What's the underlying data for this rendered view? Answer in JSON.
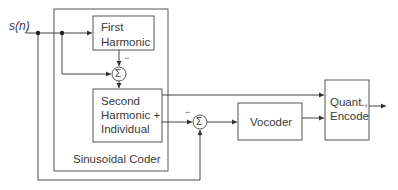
{
  "input_signal": {
    "label": "s(n)"
  },
  "outer_block": {
    "label": "Sinusoidal Coder"
  },
  "blocks": [
    {
      "id": "first-harmonic",
      "lines": [
        "First",
        "Harmonic"
      ]
    },
    {
      "id": "second-harmonic",
      "lines": [
        "Second",
        "Harmonic +",
        "Individual"
      ]
    },
    {
      "id": "vocoder",
      "lines": [
        "Vocoder"
      ]
    },
    {
      "id": "quant-encode",
      "lines": [
        "Quant.,",
        "Encode"
      ]
    }
  ],
  "summers": [
    {
      "id": "sum-1",
      "symbol": "Σ",
      "minus_label": "−"
    },
    {
      "id": "sum-2",
      "symbol": "Σ",
      "minus_label": "−"
    }
  ],
  "colors": {
    "line": "#444444",
    "box": "#555555",
    "background": "#ffffff"
  }
}
